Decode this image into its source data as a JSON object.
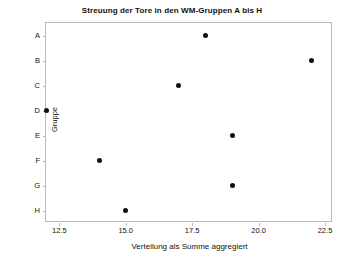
{
  "chart_data": {
    "type": "scatter",
    "title": "Streuung der Tore in den WM-Gruppen A bis H",
    "xlabel": "Verteilung als Summe aggregiert",
    "ylabel": "Gruppe",
    "grid": false,
    "legend": false,
    "legend_position": "none",
    "xlim": [
      12.0,
      22.8
    ],
    "xticks": [
      12.5,
      15.0,
      17.5,
      20.0,
      22.5
    ],
    "xtick_labels": [
      "12.5",
      "15.0",
      "17.5",
      "20.0",
      "22.5"
    ],
    "categories": [
      "A",
      "B",
      "C",
      "D",
      "E",
      "F",
      "G",
      "H"
    ],
    "ytick_labels": [
      "A",
      "B",
      "C",
      "D",
      "E",
      "F",
      "G",
      "H"
    ],
    "marker_color": "#111111",
    "points": [
      {
        "group": "A",
        "value": 18
      },
      {
        "group": "B",
        "value": 22
      },
      {
        "group": "C",
        "value": 17
      },
      {
        "group": "D",
        "value": 12
      },
      {
        "group": "E",
        "value": 19
      },
      {
        "group": "F",
        "value": 14
      },
      {
        "group": "G",
        "value": 19
      },
      {
        "group": "H",
        "value": 15
      }
    ],
    "values": [
      18,
      22,
      17,
      12,
      19,
      14,
      19,
      15
    ]
  }
}
